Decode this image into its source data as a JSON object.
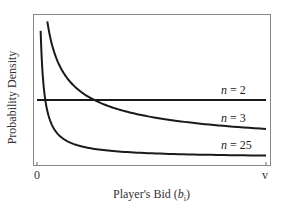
{
  "chart_data": {
    "type": "line",
    "title": "",
    "xlabel": "Player's Bid (b_i)",
    "xlabel_main": "Player's Bid (",
    "xlabel_var": "b",
    "xlabel_sub": "i",
    "xlabel_close": ")",
    "ylabel": "Probability Density",
    "x_ticks": [
      "0",
      "v"
    ],
    "xlim": [
      0,
      1
    ],
    "ylim": [
      0,
      2.4
    ],
    "grid": false,
    "legend": "inline labels at right",
    "series": [
      {
        "name": "n = 2",
        "n": 2,
        "formula": "f(b) = 1/v (uniform)",
        "x": [
          0.0,
          1.0
        ],
        "values": [
          1.0,
          1.0
        ]
      },
      {
        "name": "n = 3",
        "n": 3,
        "formula": "f(b) = (1/2) b^(-1/2)",
        "x": [
          0.045,
          0.06,
          0.08,
          0.1,
          0.15,
          0.2,
          0.25,
          0.3,
          0.4,
          0.5,
          0.6,
          0.7,
          0.8,
          0.9,
          1.0
        ],
        "values": [
          2.36,
          2.04,
          1.77,
          1.58,
          1.29,
          1.12,
          1.0,
          0.91,
          0.79,
          0.71,
          0.65,
          0.6,
          0.56,
          0.53,
          0.5
        ]
      },
      {
        "name": "n = 25",
        "n": 25,
        "formula": "f(b) = (1/24) b^(-23/24)",
        "x": [
          0.016,
          0.02,
          0.03,
          0.04,
          0.06,
          0.08,
          0.1,
          0.15,
          0.2,
          0.3,
          0.4,
          0.6,
          0.8,
          1.0
        ],
        "values": [
          2.21,
          1.79,
          1.21,
          0.92,
          0.62,
          0.47,
          0.38,
          0.26,
          0.19,
          0.13,
          0.1,
          0.068,
          0.051,
          0.042
        ]
      }
    ],
    "labels": {
      "n2": {
        "var": "n",
        "rest": " = 2"
      },
      "n3": {
        "var": "n",
        "rest": " = 3"
      },
      "n25": {
        "var": "n",
        "rest": " = 25"
      }
    }
  }
}
